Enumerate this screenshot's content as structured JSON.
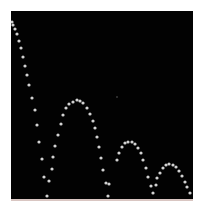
{
  "image": {
    "description": "Stroboscopic multiflash photograph of a bouncing ball on a black background",
    "background_color": "#020202",
    "frame_color": "#ffffff",
    "ball_color": "#e8e8e8",
    "floor_color": "#d9c6c2",
    "caption": "",
    "ball_positions": {
      "drop": [
        [
          12,
          22
        ],
        [
          13,
          25
        ],
        [
          15,
          29
        ],
        [
          17,
          34
        ],
        [
          19,
          41
        ],
        [
          21,
          48
        ],
        [
          23,
          57
        ],
        [
          25,
          66
        ],
        [
          27,
          75
        ],
        [
          29,
          85
        ],
        [
          32,
          98
        ],
        [
          35,
          110
        ],
        [
          37,
          125
        ],
        [
          39,
          142
        ],
        [
          42,
          159
        ],
        [
          44,
          177
        ],
        [
          47,
          196
        ]
      ],
      "bounce1": [
        [
          49,
          181
        ],
        [
          52,
          169
        ],
        [
          53,
          157
        ],
        [
          55,
          146
        ],
        [
          58,
          135
        ],
        [
          61,
          124
        ],
        [
          63,
          115
        ],
        [
          66,
          108
        ],
        [
          69,
          104
        ],
        [
          73,
          102
        ],
        [
          77,
          100
        ],
        [
          80,
          101
        ],
        [
          83,
          103
        ],
        [
          87,
          108
        ],
        [
          90,
          114
        ],
        [
          93,
          121
        ],
        [
          95,
          128
        ],
        [
          97,
          137
        ],
        [
          99,
          147
        ],
        [
          101,
          158
        ],
        [
          103,
          170
        ],
        [
          106,
          183
        ],
        [
          109,
          184
        ],
        [
          108,
          196
        ]
      ],
      "bounce2": [
        [
          117,
          160
        ],
        [
          119,
          153
        ],
        [
          122,
          147
        ],
        [
          125,
          143
        ],
        [
          128,
          142
        ],
        [
          132,
          142
        ],
        [
          135,
          144
        ],
        [
          138,
          148
        ],
        [
          141,
          153
        ],
        [
          143,
          160
        ],
        [
          146,
          168
        ],
        [
          148,
          177
        ],
        [
          151,
          186
        ],
        [
          153,
          193
        ]
      ],
      "bounce3": [
        [
          156,
          185
        ],
        [
          157,
          178
        ],
        [
          160,
          173
        ],
        [
          163,
          168
        ],
        [
          166,
          165
        ],
        [
          169,
          164
        ],
        [
          173,
          165
        ],
        [
          176,
          167
        ],
        [
          179,
          171
        ],
        [
          182,
          176
        ],
        [
          185,
          182
        ],
        [
          187,
          187
        ],
        [
          190,
          193
        ]
      ],
      "stray": [
        [
          117,
          97
        ]
      ]
    }
  }
}
